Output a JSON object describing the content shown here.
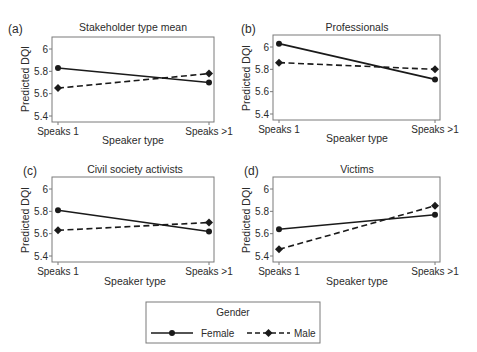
{
  "chart_data": [
    {
      "type": "line",
      "panel_label": "(a)",
      "title": "Stakeholder type mean",
      "xlabel": "Speaker type",
      "ylabel": "Predicted DQI",
      "categories": [
        "Speaks 1",
        "Speaks >1"
      ],
      "yticks": [
        5.4,
        5.6,
        5.8,
        6
      ],
      "ytick_labels": [
        "5.4",
        "5.6",
        "5.8",
        "6"
      ],
      "ylim": [
        5.37,
        6.04
      ],
      "grid": false,
      "series": [
        {
          "name": "Female",
          "style": "solid",
          "marker": "circle",
          "values": [
            5.83,
            5.7
          ]
        },
        {
          "name": "Male",
          "style": "dashed",
          "marker": "diamond",
          "values": [
            5.65,
            5.78
          ]
        }
      ]
    },
    {
      "type": "line",
      "panel_label": "(b)",
      "title": "Professionals",
      "xlabel": "Speaker type",
      "ylabel": "Predicted DQI",
      "categories": [
        "Speaks 1",
        "Speaks >1"
      ],
      "yticks": [
        5.4,
        5.6,
        5.8,
        6
      ],
      "ytick_labels": [
        "5.4",
        "5.6",
        "5.8",
        "6"
      ],
      "ylim": [
        5.37,
        6.1
      ],
      "grid": false,
      "series": [
        {
          "name": "Female",
          "style": "solid",
          "marker": "circle",
          "values": [
            6.03,
            5.71
          ]
        },
        {
          "name": "Male",
          "style": "dashed",
          "marker": "diamond",
          "values": [
            5.86,
            5.8
          ]
        }
      ]
    },
    {
      "type": "line",
      "panel_label": "(c)",
      "title": "Civil society activists",
      "xlabel": "Speaker type",
      "ylabel": "Predicted DQI",
      "categories": [
        "Speaks 1",
        "Speaks >1"
      ],
      "yticks": [
        5.4,
        5.6,
        5.8,
        6
      ],
      "ytick_labels": [
        "5.4",
        "5.6",
        "5.8",
        "6"
      ],
      "ylim": [
        5.37,
        6.04
      ],
      "grid": false,
      "series": [
        {
          "name": "Female",
          "style": "solid",
          "marker": "circle",
          "values": [
            5.81,
            5.62
          ]
        },
        {
          "name": "Male",
          "style": "dashed",
          "marker": "diamond",
          "values": [
            5.63,
            5.7
          ]
        }
      ]
    },
    {
      "type": "line",
      "panel_label": "(d)",
      "title": "Victims",
      "xlabel": "Speaker type",
      "ylabel": "Predicted DQI",
      "categories": [
        "Speaks 1",
        "Speaks >1"
      ],
      "yticks": [
        5.4,
        5.6,
        5.8,
        6
      ],
      "ytick_labels": [
        "5.4",
        "5.6",
        "5.8",
        "6"
      ],
      "ylim": [
        5.37,
        6.04
      ],
      "grid": false,
      "series": [
        {
          "name": "Female",
          "style": "solid",
          "marker": "circle",
          "values": [
            5.64,
            5.77
          ]
        },
        {
          "name": "Male",
          "style": "dashed",
          "marker": "diamond",
          "values": [
            5.46,
            5.85
          ]
        }
      ]
    }
  ],
  "legend": {
    "title": "Gender",
    "position": "bottom-center",
    "entries": [
      {
        "label": "Female",
        "style": "solid",
        "marker": "circle"
      },
      {
        "label": "Male",
        "style": "dashed",
        "marker": "diamond"
      }
    ]
  },
  "colors": {
    "line": "#1a1a1a",
    "frame": "#7a7a7a",
    "text": "#2b2b2b",
    "background": "#ffffff"
  }
}
